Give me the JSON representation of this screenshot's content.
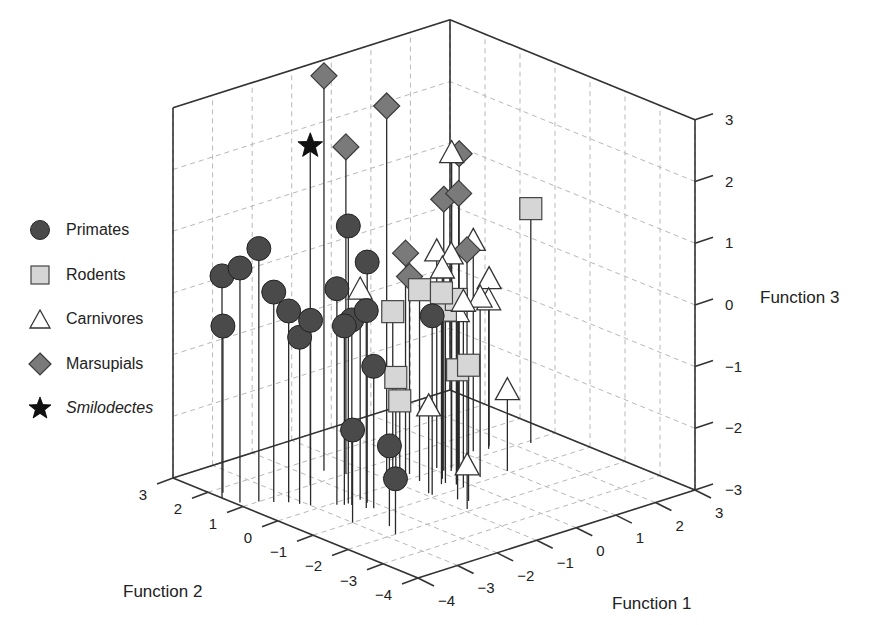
{
  "chart_data": {
    "type": "scatter",
    "subtype": "3d-stem",
    "title": "",
    "axes": {
      "x": {
        "label": "Function 1",
        "ticks": [
          -4,
          -3,
          -2,
          -1,
          0,
          1,
          2,
          3
        ],
        "range": [
          -4,
          3
        ]
      },
      "y": {
        "label": "Function 2",
        "ticks": [
          -4,
          -3,
          -2,
          -1,
          0,
          1,
          2,
          3
        ],
        "range": [
          -4,
          3
        ]
      },
      "z": {
        "label": "Function 3",
        "ticks": [
          -3,
          -2,
          -1,
          0,
          1,
          2,
          3
        ],
        "range": [
          -3,
          3
        ]
      }
    },
    "grid": true,
    "legend_position": "left",
    "series": [
      {
        "name": "Primates",
        "marker": "circle",
        "color": "#4a4a4a",
        "points": [
          [
            -4.0,
            1.6,
            0.6
          ],
          [
            -3.9,
            1.2,
            0.8
          ],
          [
            -3.6,
            1.0,
            1.1
          ],
          [
            -3.4,
            0.8,
            0.4
          ],
          [
            -3.2,
            0.6,
            0.1
          ],
          [
            -3.0,
            0.2,
            0.0
          ],
          [
            -3.8,
            1.8,
            -0.3
          ],
          [
            -3.1,
            0.4,
            -0.3
          ],
          [
            -2.4,
            -0.2,
            1.5
          ],
          [
            -2.1,
            -0.4,
            0.9
          ],
          [
            -2.6,
            -0.1,
            0.5
          ],
          [
            -2.3,
            -0.6,
            0.2
          ],
          [
            -2.4,
            -0.3,
            0.0
          ],
          [
            -2.5,
            -0.2,
            -0.1
          ],
          [
            -2.2,
            -0.7,
            -0.7
          ],
          [
            -3.0,
            -1.0,
            -1.5
          ],
          [
            -2.6,
            -1.6,
            -1.7
          ],
          [
            -2.8,
            -2.0,
            -2.1
          ],
          [
            -0.9,
            -0.9,
            -0.1
          ]
        ]
      },
      {
        "name": "Rodents",
        "marker": "square",
        "color": "#d6d6d6",
        "points": [
          [
            -1.1,
            0.0,
            -0.2
          ],
          [
            -0.6,
            -0.2,
            0.1
          ],
          [
            -0.4,
            -0.6,
            0.1
          ],
          [
            -0.2,
            -0.8,
            0.0
          ],
          [
            -0.3,
            -0.6,
            -0.2
          ],
          [
            -0.6,
            -1.6,
            -0.8
          ],
          [
            -0.7,
            -1.4,
            -0.9
          ],
          [
            -1.2,
            -0.2,
            -1.2
          ],
          [
            -1.1,
            -0.2,
            -1.6
          ],
          [
            2.3,
            -0.1,
            0.8
          ]
        ]
      },
      {
        "name": "Carnivores",
        "marker": "triangle",
        "color": "#ffffff",
        "points": [
          [
            -2.1,
            -0.2,
            0.4
          ],
          [
            0.3,
            -0.1,
            2.1
          ],
          [
            0.1,
            0.1,
            0.5
          ],
          [
            0.2,
            -0.2,
            0.5
          ],
          [
            -0.2,
            -0.4,
            0.4
          ],
          [
            -0.2,
            -1.0,
            0.0
          ],
          [
            0.0,
            -0.6,
            -0.3
          ],
          [
            0.4,
            -0.8,
            -0.1
          ],
          [
            1.2,
            0.3,
            0.4
          ],
          [
            1.6,
            0.3,
            -0.3
          ],
          [
            1.5,
            0.2,
            -0.6
          ],
          [
            1.0,
            -0.9,
            -1.7
          ],
          [
            -0.9,
            -0.8,
            -1.6
          ],
          [
            -0.9,
            -1.9,
            -2.3
          ]
        ]
      },
      {
        "name": "Marsupials",
        "marker": "diamond",
        "color": "#7a7a7a",
        "points": [
          [
            -1.6,
            1.4,
            3.4
          ],
          [
            -0.9,
            0.4,
            3.0
          ],
          [
            -1.4,
            1.0,
            2.3
          ],
          [
            0.4,
            -0.2,
            2.1
          ],
          [
            0.3,
            -0.3,
            1.5
          ],
          [
            0.1,
            -0.1,
            1.4
          ],
          [
            -0.6,
            0.2,
            0.6
          ],
          [
            0.6,
            -0.2,
            0.5
          ],
          [
            -0.5,
            0.2,
            0.2
          ]
        ]
      },
      {
        "name": "Smilodectes",
        "marker": "star",
        "color": "#111111",
        "points": [
          [
            -2.3,
            1.0,
            2.5
          ]
        ]
      }
    ]
  },
  "legend": {
    "items": [
      {
        "label": "Primates",
        "marker": "circle",
        "italic": false
      },
      {
        "label": "Rodents",
        "marker": "square",
        "italic": false
      },
      {
        "label": "Carnivores",
        "marker": "triangle",
        "italic": false
      },
      {
        "label": "Marsupials",
        "marker": "diamond",
        "italic": false
      },
      {
        "label": "Smilodectes",
        "marker": "star",
        "italic": true
      }
    ]
  },
  "labels": {
    "function1": "Function 1",
    "function2": "Function 2",
    "function3": "Function 3"
  },
  "ticks": {
    "z": [
      "3",
      "2",
      "1",
      "0",
      "−1",
      "−2",
      "−3"
    ],
    "y": [
      "3",
      "2",
      "1",
      "0",
      "−1",
      "−2",
      "−3",
      "−4"
    ],
    "x": [
      "−4",
      "−3",
      "−2",
      "−1",
      "0",
      "1",
      "2",
      "3"
    ]
  }
}
